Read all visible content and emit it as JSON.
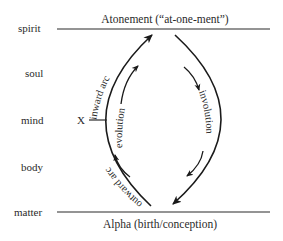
{
  "diagram": {
    "top_caption": "Atonement (“at-one-ment”)",
    "bottom_caption": "Alpha (birth/conception)",
    "levels": [
      {
        "label": "spirit"
      },
      {
        "label": "soul"
      },
      {
        "label": "mind"
      },
      {
        "label": "body"
      },
      {
        "label": "matter"
      }
    ],
    "marker": {
      "label": "X",
      "level": "mind"
    },
    "arcs": {
      "outer_left_upper": "inward arc",
      "outer_left_lower": "outward arc",
      "inner_left": "evolution",
      "inner_right": "involution"
    },
    "colors": {
      "ink": "#1a1a1a",
      "background": "#ffffff"
    }
  }
}
